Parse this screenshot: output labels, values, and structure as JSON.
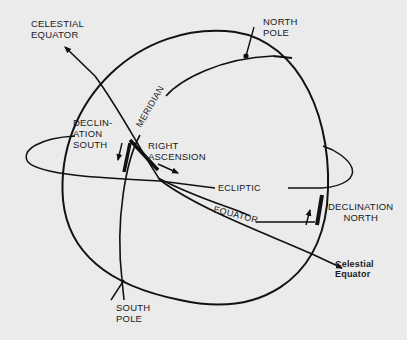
{
  "labels": {
    "celestial_equator_top": "CELESTIAL\nEQUATOR",
    "north_pole": "NORTH\nPOLE",
    "meridian": "MERIDIAN",
    "declination_south": "DECLIN-\nATION\nSOUTH",
    "right_ascension": "RIGHT\nASCENSION",
    "ecliptic": "ECLIPTIC",
    "equator": "EQUATOR",
    "declination_north": "DECLINATION\nNORTH",
    "celestial_equator_bottom": "Celestial\nEquator",
    "south_pole": "SOUTH\nPOLE"
  },
  "colors": {
    "background": "#ebebeb",
    "ink": "#111111"
  }
}
